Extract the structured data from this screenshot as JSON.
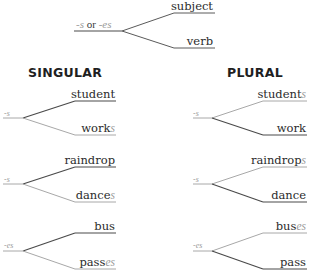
{
  "legend": {
    "suffix_a": "-s",
    "connector": " or ",
    "suffix_b": "-es",
    "upper": "subject",
    "lower": "verb"
  },
  "headings": {
    "singular": "SINGULAR",
    "plural": "PLURAL"
  },
  "colors": {
    "dark_line": "#4a4a4a",
    "light_line": "#a8a8a8",
    "text": "#2b2b2b",
    "suffix": "#9a9a9a"
  },
  "singular": [
    {
      "suffix": "-s",
      "subject": "student",
      "verb_stem": "work",
      "verb_ending": "s"
    },
    {
      "suffix": "-s",
      "subject": "raindrop",
      "verb_stem": "dance",
      "verb_ending": "s"
    },
    {
      "suffix": "-es",
      "subject": "bus",
      "verb_stem": "pass",
      "verb_ending": "es"
    }
  ],
  "plural": [
    {
      "suffix": "-s",
      "subject_stem": "student",
      "subject_ending": "s",
      "verb": "work"
    },
    {
      "suffix": "-s",
      "subject_stem": "raindrop",
      "subject_ending": "s",
      "verb": "dance"
    },
    {
      "suffix": "-es",
      "subject_stem": "bus",
      "subject_ending": "es",
      "verb": "pass"
    }
  ]
}
